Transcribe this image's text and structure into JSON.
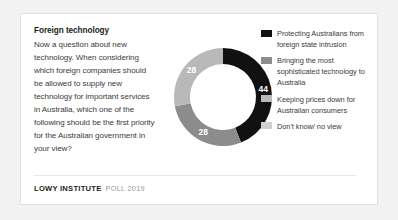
{
  "card": {
    "question_title": "Foreign technology",
    "question_body": "Now a question about new technology. When considering which foreign companies should be allowed to supply new technology for important services in Australia, which one of the following should be the first priority for the Australian government in your view?"
  },
  "footer": {
    "brand": "LOWY INSTITUTE",
    "brand_sub": "POLL 2019"
  },
  "colors": {
    "series_1": "#111111",
    "series_2": "#8c8c8c",
    "series_3": "#b9b9b9",
    "series_4": "#d0d0d0",
    "card_background": "#ffffff",
    "page_background": "#f2f2f2",
    "label_text": "#ffffff"
  },
  "legend": {
    "items": [
      {
        "label": "Protecting Australians from foreign state intrusion",
        "color": "#111111"
      },
      {
        "label": "Bringing the most sophisticated technology to Australia",
        "color": "#8c8c8c"
      },
      {
        "label": "Keeping prices down for Australian consumers",
        "color": "#b9b9b9"
      },
      {
        "label": "Don't know/ no view",
        "color": "#d0d0d0"
      }
    ]
  },
  "chart_data": {
    "type": "pie",
    "variant": "donut",
    "title": "Foreign technology",
    "unit": "percent",
    "categories": [
      "Protecting Australians from foreign state intrusion",
      "Bringing the most sophisticated technology to Australia",
      "Keeping prices down for Australian consumers",
      "Don't know/ no view"
    ],
    "values": [
      44,
      28,
      28,
      0
    ],
    "labels_shown": [
      "44",
      "28",
      "28",
      ""
    ],
    "colors": [
      "#111111",
      "#8c8c8c",
      "#b9b9b9",
      "#d0d0d0"
    ],
    "start_angle_deg": 0,
    "direction": "clockwise",
    "legend_position": "right",
    "grid": false
  }
}
